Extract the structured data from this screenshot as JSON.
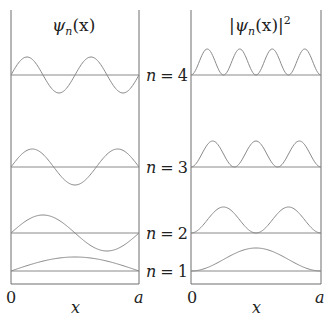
{
  "title_left": "ψ_n(x)",
  "title_left_parts": {
    "psi": "ψ",
    "sub": "n",
    "rest": "(x)"
  },
  "title_right_parts": {
    "bar_open": "|",
    "psi": "ψ",
    "sub": "n",
    "rest": "(x)",
    "bar_close": "|",
    "sup": "2"
  },
  "levels": [
    {
      "n": 4,
      "label": "n = 4",
      "baseline_y": 75
    },
    {
      "n": 3,
      "label": "n = 3",
      "baseline_y": 167
    },
    {
      "n": 2,
      "label": "n = 2",
      "baseline_y": 233
    },
    {
      "n": 1,
      "label": "n = 1",
      "baseline_y": 271
    }
  ],
  "level_labels": {
    "n_var": "n",
    "eq": "=",
    "n4": "4",
    "n3": "3",
    "n2": "2",
    "n1": "1"
  },
  "left_axis": {
    "x_min_label": "0",
    "x_max_label": "a",
    "x_label": "x"
  },
  "right_axis": {
    "x_min_label": "0",
    "x_max_label": "a",
    "x_label": "x"
  },
  "colors": {
    "curve": "#8a8a8a",
    "frame": "#6e6e6e",
    "baseline": "#8a8a8a",
    "text": "#222222"
  },
  "geometry": {
    "left_box": {
      "x0": 11,
      "x1": 139,
      "top": 10,
      "bottom": 284
    },
    "right_box": {
      "x0": 191,
      "x1": 321,
      "top": 10,
      "bottom": 284
    },
    "psi_amplitude": 18,
    "prob_amplitude": 26
  }
}
